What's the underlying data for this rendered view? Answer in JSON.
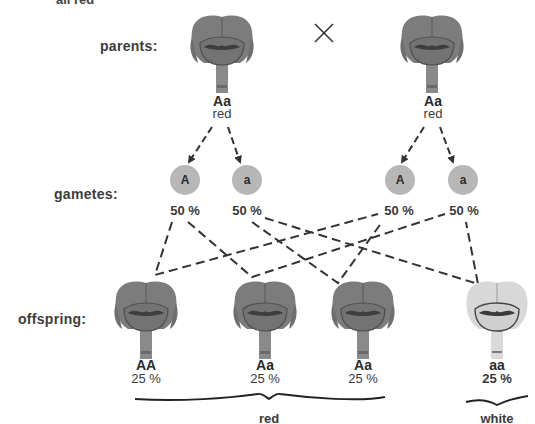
{
  "header_fragment": "all red",
  "cross_symbol": "×",
  "rows": {
    "parents": "parents:",
    "gametes": "gametes:",
    "offspring": "offspring:"
  },
  "parents": [
    {
      "genotype": "Aa",
      "phenotype": "red",
      "color": "#7a7a7a"
    },
    {
      "genotype": "Aa",
      "phenotype": "red",
      "color": "#7a7a7a"
    }
  ],
  "gametes": [
    {
      "allele": "A",
      "percent": "50 %"
    },
    {
      "allele": "a",
      "percent": "50 %"
    },
    {
      "allele": "A",
      "percent": "50 %"
    },
    {
      "allele": "a",
      "percent": "50 %"
    }
  ],
  "offspring": [
    {
      "genotype": "AA",
      "percent": "25 %",
      "color": "#7a7a7a"
    },
    {
      "genotype": "Aa",
      "percent": "25 %",
      "color": "#7a7a7a"
    },
    {
      "genotype": "Aa",
      "percent": "25 %",
      "color": "#7a7a7a"
    },
    {
      "genotype": "aa",
      "percent": "25 %",
      "color": "#d6d6d6"
    }
  ],
  "groups": {
    "red": "red",
    "white": "white"
  },
  "colors": {
    "red_flower": "#7a7a7a",
    "white_flower": "#d6d6d6",
    "gamete_fill": "#b7b7b7",
    "dashed_line": "#3a3a3a"
  }
}
